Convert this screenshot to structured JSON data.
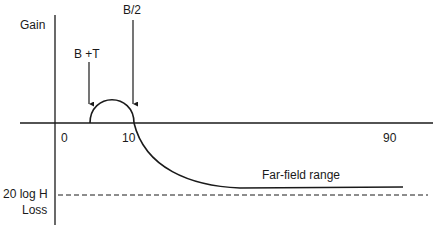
{
  "diagram": {
    "y_axis_label_top": "Gain",
    "y_axis_label_bottom": "Loss",
    "reference_level_label": "20 log H",
    "annotations": {
      "start_marker": "B +T",
      "peak_end_marker": "B/2",
      "far_field": "Far-field range"
    },
    "x_ticks": [
      "0",
      "10",
      "90"
    ],
    "colors": {
      "ink": "#1a1a1a",
      "background": "#ffffff"
    }
  }
}
